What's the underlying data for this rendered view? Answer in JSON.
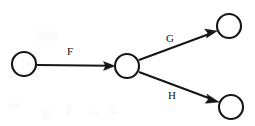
{
  "diagram": {
    "background_color": "#ffffff",
    "stroke_color": "#161616",
    "label_color": "#111111",
    "node_radius": 12,
    "nodes": [
      {
        "id": "n1",
        "name": "left-node",
        "label": "",
        "cx": 24,
        "cy": 64
      },
      {
        "id": "n2",
        "name": "middle-node",
        "label": "",
        "cx": 127,
        "cy": 66
      },
      {
        "id": "n3",
        "name": "top-right-node",
        "label": "",
        "cx": 229,
        "cy": 26
      },
      {
        "id": "n4",
        "name": "bottom-right-node",
        "label": "",
        "cx": 231,
        "cy": 107
      }
    ],
    "edges": [
      {
        "id": "e1",
        "name": "edge-f",
        "label": "F",
        "from": "n1",
        "to": "n2",
        "x1": 37,
        "y1": 65,
        "x2": 115,
        "y2": 66,
        "label_x": 70,
        "label_y": 55
      },
      {
        "id": "e2",
        "name": "edge-g",
        "label": "G",
        "from": "n2",
        "to": "n3",
        "x1": 139,
        "y1": 60,
        "x2": 217,
        "y2": 31,
        "label_x": 170,
        "label_y": 42
      },
      {
        "id": "e3",
        "name": "edge-h",
        "label": "H",
        "from": "n2",
        "to": "n4",
        "x1": 139,
        "y1": 72,
        "x2": 219,
        "y2": 102,
        "label_x": 172,
        "label_y": 99
      }
    ]
  }
}
